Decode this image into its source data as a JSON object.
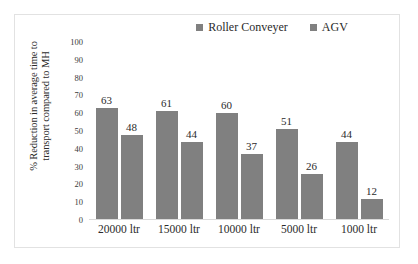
{
  "chart_data": {
    "type": "bar",
    "title": "",
    "subtitle": "",
    "xlabel": "",
    "ylabel": "% Reduction in average time to transport compared to MH",
    "ylabel_line1": "% Reduction in average time to",
    "ylabel_line2": "transport compared to MH",
    "categories": [
      "20000 ltr",
      "15000 ltr",
      "10000 ltr",
      "5000 ltr",
      "1000 ltr"
    ],
    "series": [
      {
        "name": "Roller Conveyer",
        "color": "#808080",
        "values": [
          63,
          61,
          60,
          51,
          44
        ],
        "labels": [
          "63",
          "61",
          "60",
          "51",
          "44"
        ]
      },
      {
        "name": "AGV",
        "color": "#808080",
        "values": [
          48,
          44,
          37,
          26,
          12
        ],
        "labels": [
          "48",
          "44",
          "37",
          "26",
          "12"
        ]
      }
    ],
    "ylim": [
      0,
      100
    ],
    "ytick_step": 10,
    "yticks": [
      "100",
      "90",
      "80",
      "70",
      "60",
      "50",
      "40",
      "30",
      "20",
      "10",
      "0"
    ],
    "ytick_values": [
      100,
      90,
      80,
      70,
      60,
      50,
      40,
      30,
      20,
      10,
      0
    ],
    "grid": false,
    "legend_position": "top-right",
    "data_labels": true,
    "plot_background": "#ffffff",
    "border_color": "#e2e2e2",
    "axis_color": "#d9d9d9",
    "text_color": "#2b2b2b"
  }
}
